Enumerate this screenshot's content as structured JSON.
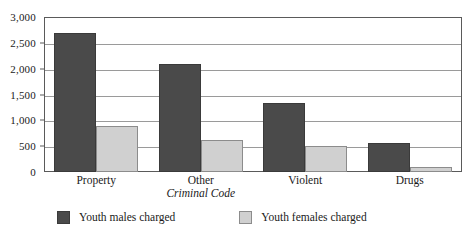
{
  "chart_data": {
    "type": "bar",
    "title": "",
    "subtitle": "",
    "xlabel": "",
    "ylabel": "",
    "ylim": [
      0,
      3000
    ],
    "ytick_step": 500,
    "ytick_labels": [
      "3,000",
      "2,500",
      "2,000",
      "1,500",
      "1,000",
      "500",
      "0"
    ],
    "ytick_values": [
      3000,
      2500,
      2000,
      1500,
      1000,
      500,
      0
    ],
    "grid": true,
    "grid_axis": "y",
    "legend_position": "bottom-left",
    "categories": [
      "Property",
      "Other Criminal Code",
      "Violent",
      "Drugs"
    ],
    "category_labels": [
      {
        "line1": "Property",
        "line2": ""
      },
      {
        "line1": "Other",
        "line2": "Criminal Code"
      },
      {
        "line1": "Violent",
        "line2": ""
      },
      {
        "line1": "Drugs",
        "line2": ""
      }
    ],
    "series": [
      {
        "name": "Youth males charged",
        "color": "#4a4a4a",
        "values": [
          2700,
          2100,
          1340,
          570
        ]
      },
      {
        "name": "Youth females charged",
        "color": "#d0d0d0",
        "values": [
          900,
          620,
          500,
          90
        ]
      }
    ]
  },
  "legend": {
    "items": [
      {
        "label": "Youth males charged",
        "color": "#4a4a4a"
      },
      {
        "label": "Youth females charged",
        "color": "#d0d0d0"
      }
    ]
  },
  "colors": {
    "males": "#4a4a4a",
    "females": "#d0d0d0",
    "gridline": "#9a9a9a",
    "frame": "#5a5a5a",
    "text": "#1a1a1a",
    "background": "#ffffff"
  }
}
